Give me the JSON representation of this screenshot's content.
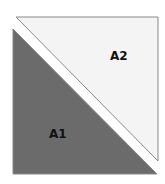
{
  "diagram": {
    "regions": [
      {
        "id": "A1",
        "label": "A1",
        "fill": "#6b6b6b",
        "shape": "lower-left triangle"
      },
      {
        "id": "A2",
        "label": "A2",
        "fill": "#f4f4f4",
        "shape": "upper-right triangle"
      }
    ],
    "divider": {
      "color": "#ffffff",
      "orientation": "diagonal top-left to bottom-right"
    },
    "border_color": "#888888"
  }
}
